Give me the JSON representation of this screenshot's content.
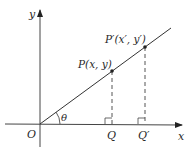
{
  "diagram": {
    "axes": {
      "x_label": "x",
      "y_label": "y",
      "origin_label": "O"
    },
    "angle_label": "θ",
    "points": [
      {
        "id": "P",
        "label": "P(x, y)"
      },
      {
        "id": "P_prime",
        "label": "P′(x′, y′)"
      }
    ],
    "feet": [
      {
        "id": "Q",
        "label": "Q"
      },
      {
        "id": "Q_prime",
        "label": "Q′"
      }
    ],
    "colors": {
      "line": "#333333",
      "text": "#2a2a2a",
      "background": "#ffffff"
    }
  }
}
